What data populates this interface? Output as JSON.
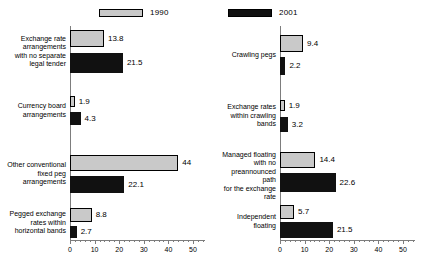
{
  "chart_data": {
    "type": "bar",
    "orientation": "horizontal",
    "title": "",
    "xlabel": "",
    "ylabel": "",
    "xlim": [
      0,
      55
    ],
    "xticks": [
      0,
      10,
      20,
      30,
      40,
      50
    ],
    "xtick_labels": [
      "0",
      "10",
      "20",
      "30",
      "40",
      "50"
    ],
    "minor_tick_step": 2,
    "grid": false,
    "legend": {
      "position": "top",
      "entries": [
        {
          "name": "1990",
          "color": "#c9c9c9"
        },
        {
          "name": "2001",
          "color": "#111111"
        }
      ]
    },
    "panels": [
      {
        "id": "left-panel",
        "categories": [
          "Exchange rate arrangements with no separate legal tender",
          "Currency board arrangements",
          "Other conventional fixed peg arrangements",
          "Pegged exchange rates within horizontal bands"
        ],
        "series": [
          {
            "name": "1990",
            "values": [
              13.8,
              1.9,
              44,
              8.8
            ]
          },
          {
            "name": "2001",
            "values": [
              21.5,
              4.3,
              22.1,
              2.7
            ]
          }
        ]
      },
      {
        "id": "right-panel",
        "categories": [
          "Crawling pegs",
          "Exchange rates within crawling bands",
          "Managed floating with no preannounced path for the exchange rate",
          "Independent floating"
        ],
        "series": [
          {
            "name": "1990",
            "values": [
              9.4,
              1.9,
              14.4,
              5.7
            ]
          },
          {
            "name": "2001",
            "values": [
              2.2,
              3.2,
              22.6,
              21.5
            ]
          }
        ]
      }
    ]
  },
  "left": {
    "legend_label": "1990",
    "categories": [
      {
        "lines": [
          "Exchange rate",
          "arrangements",
          "with no separate",
          "legal tender"
        ]
      },
      {
        "lines": [
          "Currency board",
          "arrangements"
        ]
      },
      {
        "lines": [
          "Other conventional",
          "fixed peg",
          "arrangements"
        ]
      },
      {
        "lines": [
          "Pegged exchange",
          "rates within",
          "horizontal bands"
        ]
      }
    ],
    "values": {
      "c0_1990": "13.8",
      "c0_2001": "21.5",
      "c1_1990": "1.9",
      "c1_2001": "4.3",
      "c2_1990": "44",
      "c2_2001": "22.1",
      "c3_1990": "8.8",
      "c3_2001": "2.7"
    },
    "axis": {
      "t0": "0",
      "t10": "10",
      "t20": "20",
      "t30": "30",
      "t40": "40",
      "t50": "50"
    }
  },
  "right": {
    "legend_label": "2001",
    "categories": [
      {
        "lines": [
          "Crawling pegs"
        ]
      },
      {
        "lines": [
          "Exchange rates",
          "within crawling",
          "bands"
        ]
      },
      {
        "lines": [
          "Managed floating",
          "with no",
          "preannounced path",
          "for the exchange",
          "rate"
        ]
      },
      {
        "lines": [
          "Independent",
          "floating"
        ]
      }
    ],
    "values": {
      "c0_1990": "9.4",
      "c0_2001": "2.2",
      "c1_1990": "1.9",
      "c1_2001": "3.2",
      "c2_1990": "14.4",
      "c2_2001": "22.6",
      "c3_1990": "5.7",
      "c3_2001": "21.5"
    },
    "axis": {
      "t0": "0",
      "t10": "10",
      "t20": "20",
      "t30": "30",
      "t40": "40",
      "t50": "50"
    }
  }
}
